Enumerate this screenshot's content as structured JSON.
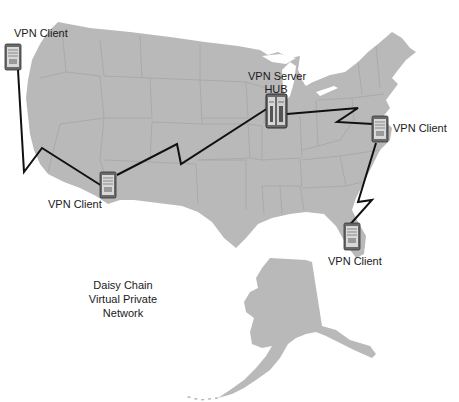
{
  "diagram": {
    "title_lines": [
      "Daisy Chain",
      "Virtual Private",
      "Network"
    ],
    "colors": {
      "background": "#ffffff",
      "land": "#b9b9b9",
      "state_borders": "#a6a6a6",
      "link_line": "#111111",
      "server_body": "#6a6a6a",
      "server_face": "#d8d8d8"
    },
    "nodes": [
      {
        "id": "west-client",
        "label": "VPN Client",
        "type": "client"
      },
      {
        "id": "southwest-client",
        "label": "VPN Client",
        "type": "client"
      },
      {
        "id": "hub",
        "label_lines": [
          "VPN Server",
          "HUB"
        ],
        "type": "server-hub"
      },
      {
        "id": "east-client",
        "label": "VPN Client",
        "type": "client"
      },
      {
        "id": "florida-client",
        "label": "VPN Client",
        "type": "client"
      }
    ],
    "links": [
      {
        "from": "west-client",
        "to": "southwest-client",
        "style": "lightning"
      },
      {
        "from": "southwest-client",
        "to": "hub",
        "style": "lightning"
      },
      {
        "from": "hub",
        "to": "east-client",
        "style": "lightning"
      },
      {
        "from": "east-client",
        "to": "florida-client",
        "style": "lightning"
      }
    ],
    "map_regions": [
      "contiguous-united-states",
      "alaska"
    ]
  }
}
